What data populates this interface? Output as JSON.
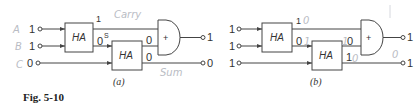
{
  "figure": {
    "caption": "Fig. 5-10",
    "block_label": "HA",
    "or_symbol": "+"
  },
  "circuit_a": {
    "label": "(a)",
    "inputs": [
      "1",
      "1",
      "0"
    ],
    "handwritten_input_names": [
      "A",
      "B",
      "C"
    ],
    "ha1_carry_out": "1",
    "ha1_sum_out": "0",
    "ha1_sum_annotation": "S",
    "ha2_carry_out": "0",
    "ha2_sum_out": "0",
    "outputs": [
      "1",
      "0"
    ],
    "handwritten_carry": "Carry",
    "handwritten_sum": "Sum"
  },
  "circuit_b": {
    "label": "(b)",
    "inputs": [
      "1",
      "1",
      "1"
    ],
    "ha1_carry_out": "1",
    "ha1_carry_annotation": "0",
    "ha1_sum_out": "0",
    "ha1_sum_annotation": "1",
    "ha2_carry_out": "0",
    "ha2_carry_annotation": "1",
    "ha2_sum_out": "1",
    "ha2_sum_annotation": "0",
    "outputs": [
      "1",
      "1"
    ],
    "handwritten_side": "0"
  },
  "colors": {
    "ink": "#444444",
    "pencil": "#b9bcc4"
  }
}
